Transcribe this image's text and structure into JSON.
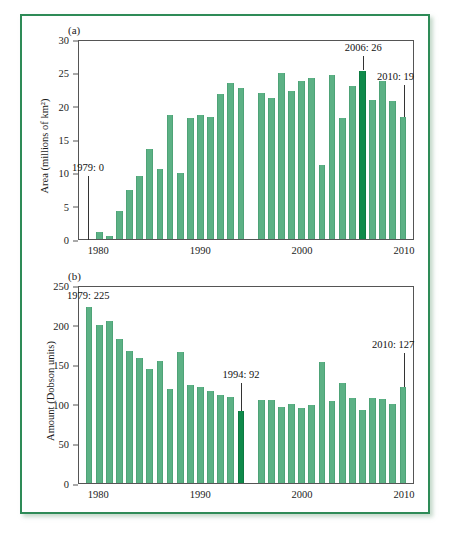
{
  "figure": {
    "border_color": "#2e8b57",
    "bar_color": "#5cb185",
    "highlight_color": "#0f8a4a"
  },
  "chart_data": [
    {
      "type": "bar",
      "panel": "(a)",
      "title": "",
      "xlabel": "",
      "ylabel": "Area (millions of km²)",
      "ylim": [
        0,
        30
      ],
      "yticks": [
        0,
        5,
        10,
        15,
        20,
        25,
        30
      ],
      "xlim": [
        1979,
        2010
      ],
      "xticks": [
        1980,
        1990,
        2000,
        2010
      ],
      "grid": false,
      "legend": "none",
      "highlight_category": 2006,
      "categories": [
        1979,
        1980,
        1981,
        1982,
        1983,
        1984,
        1985,
        1986,
        1987,
        1988,
        1989,
        1990,
        1991,
        1992,
        1993,
        1994,
        1995,
        1996,
        1997,
        1998,
        1999,
        2000,
        2001,
        2002,
        2003,
        2004,
        2005,
        2006,
        2007,
        2008,
        2009,
        2010
      ],
      "values": [
        0,
        1.0,
        0.4,
        4.3,
        7.4,
        9.5,
        13.6,
        10.6,
        18.8,
        10.0,
        18.3,
        18.8,
        18.5,
        21.9,
        23.6,
        22.9,
        null,
        22.1,
        21.4,
        25.1,
        22.5,
        24.0,
        24.4,
        11.2,
        24.9,
        18.4,
        23.2,
        25.5,
        21.0,
        23.9,
        20.9,
        18.5
      ],
      "annotations": [
        {
          "label": "1979: 0",
          "category": 1979,
          "value": 0
        },
        {
          "label": "2006: 26",
          "category": 2006,
          "value": 25.5
        },
        {
          "label": "2010: 19",
          "category": 2010,
          "value": 18.5
        }
      ]
    },
    {
      "type": "bar",
      "panel": "(b)",
      "title": "",
      "xlabel": "",
      "ylabel": "Amount (Dobson units)",
      "ylim": [
        0,
        250
      ],
      "yticks": [
        0,
        50,
        100,
        150,
        200,
        250
      ],
      "xlim": [
        1979,
        2010
      ],
      "xticks": [
        1980,
        1990,
        2000,
        2010
      ],
      "grid": false,
      "legend": "none",
      "highlight_category": 1994,
      "categories": [
        1979,
        1980,
        1981,
        1982,
        1983,
        1984,
        1985,
        1986,
        1987,
        1988,
        1989,
        1990,
        1991,
        1992,
        1993,
        1994,
        1995,
        1996,
        1997,
        1998,
        1999,
        2000,
        2001,
        2002,
        2003,
        2004,
        2005,
        2006,
        2007,
        2008,
        2009,
        2010
      ],
      "values": [
        225,
        201,
        207,
        184,
        169,
        160,
        145,
        156,
        120,
        167,
        125,
        122,
        117,
        112,
        110,
        92,
        null,
        106,
        106,
        97,
        101,
        96,
        99,
        154,
        105,
        128,
        108,
        93,
        109,
        107,
        101,
        123
      ],
      "annotations": [
        {
          "label": "1979: 225",
          "category": 1979,
          "value": 225
        },
        {
          "label": "1994: 92",
          "category": 1994,
          "value": 92
        },
        {
          "label": "2010: 127",
          "category": 2010,
          "value": 123
        }
      ]
    }
  ]
}
